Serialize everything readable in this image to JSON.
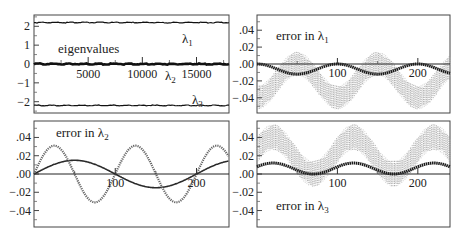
{
  "chart_data": [
    {
      "panel": "top-left",
      "type": "line",
      "title": "",
      "annotation": "eigenvalues",
      "xlabel": "",
      "ylabel": "",
      "xlim": [
        0,
        18000
      ],
      "ylim": [
        -2.6,
        2.6
      ],
      "xticks": [
        5000,
        10000,
        15000
      ],
      "xtick_labels": [
        "5000",
        "10000",
        "15000"
      ],
      "yticks": [
        2,
        1,
        0,
        -1,
        -2
      ],
      "ytick_labels": [
        "2",
        "1",
        "0",
        "−1",
        "−2"
      ],
      "series": [
        {
          "name": "λ1",
          "label": "λ₁",
          "values_constant": 2.2
        },
        {
          "name": "λ2",
          "label": "λ₂",
          "values_constant": 0.0
        },
        {
          "name": "λ3",
          "label": "λ₃",
          "values_constant": -2.2
        }
      ]
    },
    {
      "panel": "top-right",
      "type": "line",
      "annotation": "error in λ₁",
      "xlim": [
        0,
        240
      ],
      "ylim": [
        -0.058,
        0.058
      ],
      "xticks": [
        100,
        200
      ],
      "xtick_labels": [
        "100",
        "200"
      ],
      "yticks": [
        0.04,
        0.02,
        0.0,
        -0.02,
        -0.04
      ],
      "ytick_labels": [
        ".04",
        ".02",
        ".00",
        "−.02",
        "−.04"
      ],
      "series": [
        {
          "name": "mean error (dark)",
          "form": "oscillating",
          "center": -0.006,
          "amplitude": 0.006,
          "period": 100,
          "phase_peak_x": 100
        },
        {
          "name": "scatter band (light)",
          "form": "oscillating band",
          "center": -0.02,
          "amplitude": 0.02,
          "period": 100,
          "band_halfwidth": 0.012
        }
      ]
    },
    {
      "panel": "bottom-left",
      "type": "line",
      "annotation": "error in λ₂",
      "xlim": [
        0,
        240
      ],
      "ylim": [
        -0.058,
        0.058
      ],
      "xticks": [
        100,
        200
      ],
      "xtick_labels": [
        "100",
        "200"
      ],
      "yticks": [
        0.04,
        0.02,
        0.0,
        -0.02,
        -0.04
      ],
      "ytick_labels": [
        ".04",
        ".02",
        ".00",
        "−.02",
        "−.04"
      ],
      "series": [
        {
          "name": "slow sinusoid (solid)",
          "form": "sine",
          "amplitude": 0.015,
          "period": 200,
          "phase_zero_x": 0
        },
        {
          "name": "fast sinusoid (dotted)",
          "form": "sine",
          "amplitude": 0.031,
          "period": 100,
          "phase_zero_x": 0
        }
      ]
    },
    {
      "panel": "bottom-right",
      "type": "line",
      "annotation": "error in λ₃",
      "xlim": [
        0,
        240
      ],
      "ylim": [
        -0.058,
        0.058
      ],
      "xticks": [
        100,
        200
      ],
      "xtick_labels": [
        "100",
        "200"
      ],
      "yticks": [
        0.04,
        0.02,
        0.0,
        -0.02,
        -0.04
      ],
      "ytick_labels": [
        ".04",
        ".02",
        ".00",
        "−.02",
        "−.04"
      ],
      "series": [
        {
          "name": "mean error (dark)",
          "form": "oscillating",
          "center": 0.006,
          "amplitude": 0.006,
          "period": 100,
          "phase_peak_x": 120
        },
        {
          "name": "scatter band (light)",
          "form": "oscillating band",
          "center": 0.02,
          "amplitude": 0.02,
          "period": 100,
          "band_halfwidth": 0.012
        }
      ]
    }
  ],
  "labels": {
    "eigenvalues": "eigenvalues",
    "lambda1": "λ",
    "lambda2": "λ",
    "lambda3": "λ",
    "sub1": "1",
    "sub2": "2",
    "sub3": "3",
    "error_in": "error in λ"
  }
}
